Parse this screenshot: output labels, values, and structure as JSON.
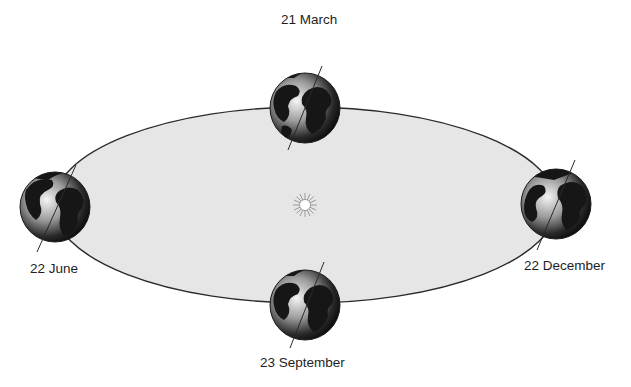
{
  "diagram": {
    "colors": {
      "background": "#ffffff",
      "orbit_fill": "#e6e6e6",
      "orbit_stroke": "#2a2a2a",
      "earth_dark": "#151515",
      "earth_light": "#f2f2f2",
      "sun_core": "#ffffff",
      "sun_rays": "#9a9a9a",
      "label_text": "#1e1e1e"
    },
    "orbit": {
      "cx": 305,
      "cy": 205,
      "rx": 252,
      "ry": 98
    },
    "sun": {
      "x": 305,
      "y": 205,
      "name": "sun-icon"
    },
    "positions": [
      {
        "id": "march",
        "label": "21 March",
        "x": 305,
        "y": 108,
        "r": 35
      },
      {
        "id": "june",
        "label": "22 June",
        "x": 55,
        "y": 207,
        "r": 35
      },
      {
        "id": "december",
        "label": "22 December",
        "x": 556,
        "y": 204,
        "r": 35
      },
      {
        "id": "september",
        "label": "23 September",
        "x": 305,
        "y": 305,
        "r": 35
      }
    ]
  }
}
